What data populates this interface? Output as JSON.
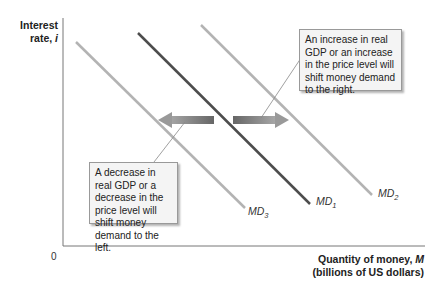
{
  "diagram": {
    "y_axis": {
      "line1": "Interest",
      "line2": "rate, i"
    },
    "x_axis": {
      "line1": "Quantity of money, M",
      "line2": "(billions of US dollars)"
    },
    "origin": "0",
    "curves": [
      {
        "id": "MD3",
        "base": "MD",
        "sub": "3",
        "role": "decreased demand",
        "color": "#b3b3b3"
      },
      {
        "id": "MD1",
        "base": "MD",
        "sub": "1",
        "role": "original demand",
        "color": "#4d4d4d"
      },
      {
        "id": "MD2",
        "base": "MD",
        "sub": "2",
        "role": "increased demand",
        "color": "#b3b3b3"
      }
    ],
    "arrows": [
      {
        "id": "shift-left",
        "direction": "left"
      },
      {
        "id": "shift-right",
        "direction": "right"
      }
    ],
    "callouts": {
      "right": "An increase in real GDP or an increase in the price level will shift money demand to the right.",
      "left": "A decrease in real GDP or a decrease in the price level will shift money demand to the left."
    }
  }
}
